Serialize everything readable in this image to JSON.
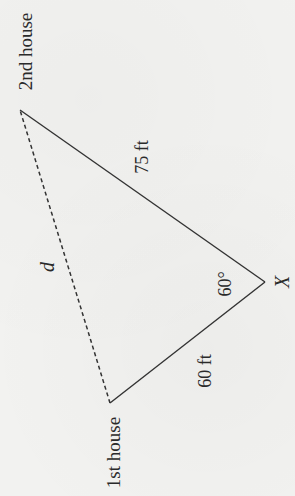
{
  "diagram": {
    "type": "triangle",
    "orientation": "rotated -90deg (reads bottom-to-top)",
    "colors": {
      "background": "#f2f2f0",
      "line": "#333333",
      "text": "#2a2a2a"
    },
    "vertices": {
      "second_house": {
        "label": "2nd house",
        "x": 20,
        "y": 110
      },
      "x_point": {
        "label": "X",
        "x": 265,
        "y": 282
      },
      "first_house": {
        "label": "1st house",
        "x": 110,
        "y": 403
      }
    },
    "edges": [
      {
        "from": "second_house",
        "to": "x_point",
        "style": "solid",
        "label": "75 ft"
      },
      {
        "from": "x_point",
        "to": "first_house",
        "style": "solid",
        "label": "60 ft"
      },
      {
        "from": "first_house",
        "to": "second_house",
        "style": "dashed",
        "label": "d"
      }
    ],
    "angle": {
      "at": "x_point",
      "label": "60°"
    },
    "labels": {
      "second_house": "2nd house",
      "first_house": "1st house",
      "x_point": "X",
      "side_a": "75 ft",
      "side_b": "60 ft",
      "side_d": "d",
      "angle_x": "60°"
    }
  }
}
